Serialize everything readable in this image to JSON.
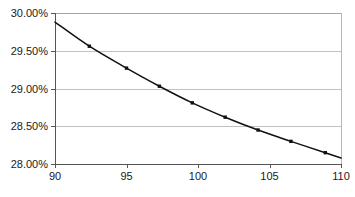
{
  "chart_data": {
    "type": "line",
    "title": "",
    "subtitle": "",
    "xlabel": "",
    "ylabel": "",
    "xlim": [
      90,
      110
    ],
    "ylim": [
      28.0,
      30.0
    ],
    "grid": true,
    "legend": null,
    "legend_position": "none",
    "x_tick_labels": [
      "90",
      "95",
      "100",
      "105",
      "110"
    ],
    "x_ticks": [
      90,
      95,
      100,
      105,
      110
    ],
    "y_tick_labels": [
      "28.00%",
      "28.50%",
      "29.00%",
      "29.50%",
      "30.00%"
    ],
    "y_ticks": [
      28.0,
      28.5,
      29.0,
      29.5,
      30.0
    ],
    "y_unit": "%",
    "marker": "square",
    "line_color": "#111111",
    "marker_color": "#111111",
    "grid_color": "#a8a8a8",
    "axis_color": "#555555",
    "background_color": "#ffffff",
    "series": [
      {
        "name": "",
        "x": [
          90.0,
          92.4,
          95.0,
          97.3,
          99.6,
          101.9,
          104.2,
          106.5,
          108.9,
          110.0
        ],
        "values": [
          29.88,
          29.56,
          29.27,
          29.03,
          28.81,
          28.62,
          28.45,
          28.3,
          28.15,
          28.08
        ]
      }
    ]
  }
}
